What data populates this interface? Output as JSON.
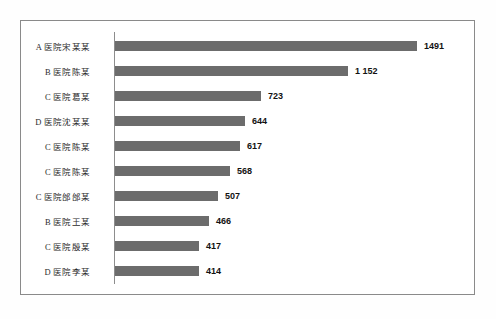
{
  "figure": {
    "bar_color": "#6c6c6c",
    "axis_color": "#8d8d8d",
    "frame_color": "#8a8a8a",
    "value_text_color": "#121212",
    "label_text_color": "#2b2b2b"
  },
  "chart_data": {
    "type": "bar",
    "orientation": "horizontal",
    "title": "",
    "subtitle": "",
    "xlabel": "",
    "ylabel": "",
    "grid": false,
    "legend": null,
    "xlim": [
      0,
      1491
    ],
    "categories": [
      "A 医院宋某某",
      "B 医院陈某",
      "C 医院葛某",
      "D 医院沈某某",
      "C 医院陈某",
      "C 医院陈某",
      "C 医院邰邰某",
      "B 医院王某",
      "C 医院殷某",
      "D 医院李某"
    ],
    "values": [
      1491,
      1152,
      723,
      644,
      617,
      568,
      507,
      466,
      417,
      414
    ],
    "value_labels": [
      "1491",
      "1 152",
      "723",
      "644",
      "617",
      "568",
      "507",
      "466",
      "417",
      "414"
    ]
  }
}
